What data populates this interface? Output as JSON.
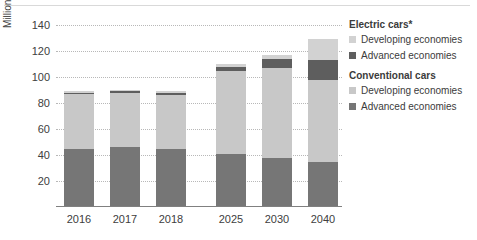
{
  "chart_data": {
    "type": "bar",
    "subtype": "stacked-bar",
    "title": "",
    "xlabel": "",
    "ylabel": "Million",
    "ylim": [
      0,
      140
    ],
    "ytick_step": 20,
    "yticks": [
      140,
      120,
      100,
      80,
      60,
      40,
      20
    ],
    "grid": true,
    "grid_style": "dotted-horizontal",
    "categories": [
      "2016",
      "2017",
      "2018",
      "2025",
      "2030",
      "2040"
    ],
    "group_gap_after_index": 2,
    "series": [
      {
        "name": "Conventional cars — Advanced economies",
        "key": "conventional_advanced",
        "color": "#767676",
        "values": [
          45,
          46,
          45,
          41,
          38,
          35
        ]
      },
      {
        "name": "Conventional cars — Developing economies",
        "key": "conventional_developing",
        "color": "#c8c8c8",
        "values": [
          42,
          42,
          41,
          64,
          69,
          63
        ]
      },
      {
        "name": "Electric cars — Advanced economies",
        "key": "electric_advanced",
        "color": "#5e5e5e",
        "values": [
          1,
          1,
          2,
          3,
          7,
          15
        ]
      },
      {
        "name": "Electric cars — Developing economies",
        "key": "electric_developing",
        "color": "#d2d2d2",
        "values": [
          1,
          1,
          1,
          2,
          3,
          16
        ]
      }
    ],
    "totals": [
      89,
      90,
      89,
      110,
      117,
      129
    ],
    "legend_position": "right"
  },
  "axis": {
    "y_title": "Million"
  },
  "legend": {
    "groups": [
      {
        "title": "Electric cars*",
        "items": [
          {
            "label": "Developing economies",
            "color": "#d2d2d2",
            "icon": "square-swatch-icon"
          },
          {
            "label": "Advanced economies",
            "color": "#5e5e5e",
            "icon": "square-swatch-icon"
          }
        ]
      },
      {
        "title": "Conventional cars",
        "items": [
          {
            "label": "Developing economies",
            "color": "#c8c8c8",
            "icon": "square-swatch-icon"
          },
          {
            "label": "Advanced economies",
            "color": "#767676",
            "icon": "square-swatch-icon"
          }
        ]
      }
    ]
  },
  "colors": {
    "background": "#ffffff",
    "text": "#404040",
    "gridline": "#b8b8b8",
    "axis": "#808080"
  }
}
